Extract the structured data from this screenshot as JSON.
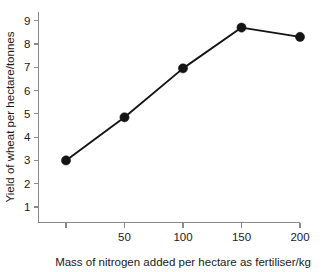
{
  "chart_data": {
    "type": "line",
    "title": "",
    "xlabel": "Mass of nitrogen added per hectare as fertiliser/kg",
    "ylabel": "Yield of wheat per hectare/tonnes",
    "x": [
      0,
      50,
      100,
      150,
      200
    ],
    "values": [
      3.0,
      4.85,
      6.95,
      8.7,
      8.3
    ],
    "series": [
      {
        "name": "Wheat yield",
        "values": [
          3.0,
          4.85,
          6.95,
          8.7,
          8.3
        ]
      }
    ],
    "xlim": [
      0,
      200
    ],
    "ylim": [
      0,
      9.4
    ],
    "xticks": [
      0,
      50,
      100,
      150,
      200
    ],
    "xtick_labels": [
      "",
      "50",
      "100",
      "150",
      "200"
    ],
    "yticks": [
      1,
      2,
      3,
      4,
      5,
      6,
      7,
      8,
      9
    ],
    "ytick_labels": [
      "1",
      "2",
      "3",
      "4",
      "5",
      "6",
      "7",
      "8",
      "9"
    ],
    "grid": false,
    "legend": "none",
    "marker": "filled-circle",
    "line_color": "#141414",
    "marker_color": "#141414",
    "axis_color": "#8a8a8a",
    "background_color": "#ffffff"
  }
}
